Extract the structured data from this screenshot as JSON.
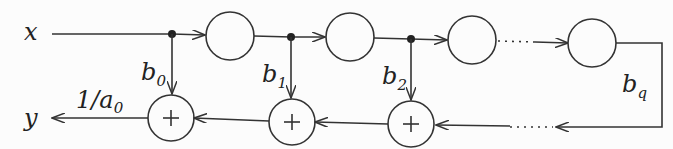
{
  "diagram": {
    "input_label": "x",
    "output_label": "y",
    "output_gain": {
      "numer": "1/a",
      "sub": "0"
    },
    "taps": [
      {
        "coef": "b",
        "sub": "0"
      },
      {
        "coef": "b",
        "sub": "1"
      },
      {
        "coef": "b",
        "sub": "2"
      },
      {
        "coef": "b",
        "sub": "q"
      }
    ],
    "adder_symbol": "+",
    "colors": {
      "stroke": "#333333",
      "background": "#fcfcfc"
    }
  }
}
